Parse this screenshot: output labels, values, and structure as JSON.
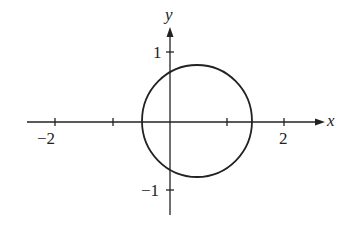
{
  "figure": {
    "x_axis_label": "x",
    "y_axis_label": "y",
    "x_ticks": [
      {
        "value": -2,
        "label": "−2"
      },
      {
        "value": -1,
        "label": ""
      },
      {
        "value": 1,
        "label": ""
      },
      {
        "value": 2,
        "label": "2"
      }
    ],
    "y_ticks": [
      {
        "value": 1,
        "label": "1"
      },
      {
        "value": -1,
        "label": "−1"
      }
    ],
    "circle": {
      "center_x": 0.5,
      "center_y": 0,
      "radius": 0.95
    },
    "colors": {
      "stroke": "#222222",
      "background": "#ffffff"
    }
  }
}
